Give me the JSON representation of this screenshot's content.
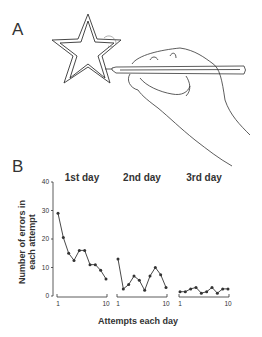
{
  "panels": {
    "a_label": "A",
    "b_label": "B"
  },
  "chart_data": {
    "type": "line",
    "title": "",
    "xlabel": "Attempts each day",
    "ylabel": "Number of errors in each attempt",
    "ylim": [
      0,
      40
    ],
    "yticks": [
      0,
      10,
      20,
      30,
      40
    ],
    "grid": false,
    "legend": null,
    "x": [
      1,
      2,
      3,
      4,
      5,
      6,
      7,
      8,
      9,
      10
    ],
    "xticks_labeled": [
      1,
      10
    ],
    "series": [
      {
        "name": "1st day",
        "values": [
          29,
          20.5,
          15,
          12.5,
          16,
          16,
          11,
          11,
          9,
          6
        ]
      },
      {
        "name": "2nd day",
        "values": [
          13,
          2.5,
          4,
          7,
          5.5,
          2,
          7,
          10,
          7.5,
          3
        ]
      },
      {
        "name": "3rd day",
        "values": [
          1.5,
          1.5,
          2.5,
          3,
          1,
          1.5,
          3,
          1,
          2.5,
          2.5
        ]
      }
    ]
  },
  "colors": {
    "ink": "#333333",
    "background": "#ffffff"
  }
}
